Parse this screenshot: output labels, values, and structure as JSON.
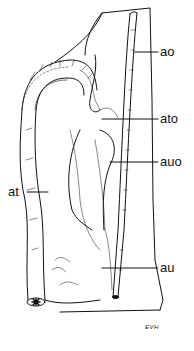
{
  "diagram": {
    "type": "anatomical illustration",
    "labels": [
      {
        "id": "ao",
        "text": "ao"
      },
      {
        "id": "ato",
        "text": "ato"
      },
      {
        "id": "auo",
        "text": "auo"
      },
      {
        "id": "at",
        "text": "at"
      },
      {
        "id": "au",
        "text": "au"
      }
    ],
    "signature": "EVH",
    "colors": {
      "ink": "#111111",
      "background": "#ffffff"
    }
  }
}
